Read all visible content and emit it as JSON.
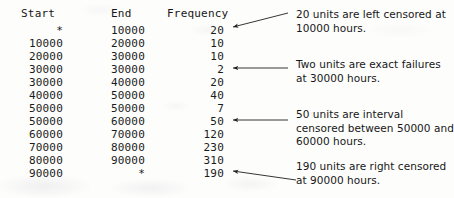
{
  "table": {
    "headers": [
      "Start",
      "End",
      "Frequency"
    ],
    "rows": [
      {
        "start": "*",
        "end": "10000",
        "frequency": "20"
      },
      {
        "start": "10000",
        "end": "20000",
        "frequency": "10"
      },
      {
        "start": "20000",
        "end": "30000",
        "frequency": "10"
      },
      {
        "start": "30000",
        "end": "30000",
        "frequency": "2"
      },
      {
        "start": "30000",
        "end": "40000",
        "frequency": "20"
      },
      {
        "start": "40000",
        "end": "50000",
        "frequency": "40"
      },
      {
        "start": "50000",
        "end": "50000",
        "frequency": "7"
      },
      {
        "start": "50000",
        "end": "60000",
        "frequency": "50"
      },
      {
        "start": "60000",
        "end": "70000",
        "frequency": "120"
      },
      {
        "start": "70000",
        "end": "80000",
        "frequency": "230"
      },
      {
        "start": "80000",
        "end": "90000",
        "frequency": "310"
      },
      {
        "start": "90000",
        "end": "*",
        "frequency": "190"
      }
    ]
  },
  "annotations": [
    {
      "text": "20 units are left censored at 10000 hours.",
      "target_row": 0,
      "target_value": "20"
    },
    {
      "text": "Two units are exact failures at 30000 hours.",
      "target_row": 3,
      "target_value": "2"
    },
    {
      "text": "50 units are interval censored between 50000 and 60000 hours.",
      "target_row": 7,
      "target_value": "50"
    },
    {
      "text": "190 units are right censored at 90000 hours.",
      "target_row": 11,
      "target_value": "190"
    }
  ],
  "colors": {
    "text": "#1b1b1b",
    "annotation_text": "#171717",
    "arrow": "#1f1f1f",
    "background": "#fdfdfc"
  }
}
